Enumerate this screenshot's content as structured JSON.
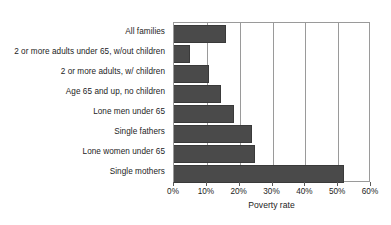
{
  "chart_data": {
    "type": "bar",
    "orientation": "horizontal",
    "title": "",
    "xlabel": "Poverty rate",
    "ylabel": "",
    "xlim": [
      0,
      60
    ],
    "xticks": [
      0,
      10,
      20,
      30,
      40,
      50,
      60
    ],
    "xtick_labels": [
      "0%",
      "10%",
      "20%",
      "30%",
      "40%",
      "50%",
      "60%"
    ],
    "grid": "vertical",
    "legend": "none",
    "bar_color": "#4a4a4a",
    "categories": [
      "All families",
      "2 or more adults under 65, w/out children",
      "2 or more adults, w/ children",
      "Age 65 and up, no children",
      "Lone men under 65",
      "Single fathers",
      "Lone women under 65",
      "Single mothers"
    ],
    "values": [
      15.5,
      4.7,
      10.5,
      14.0,
      18.0,
      23.5,
      24.5,
      51.5
    ]
  }
}
